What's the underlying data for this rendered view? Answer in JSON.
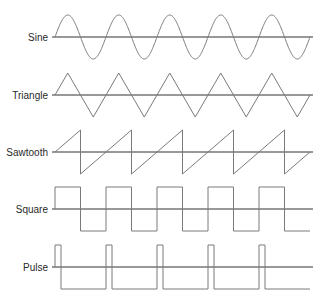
{
  "diagram": {
    "title": "",
    "colors": {
      "axis": "#333333",
      "wave": "#7a7a7a",
      "label": "#2a2a2a",
      "background": "#ffffff"
    },
    "geometry": {
      "x_start": 55,
      "x_end": 310,
      "cycles": 5,
      "amplitude": 22,
      "label_right_x": 50
    },
    "waveforms": [
      {
        "name": "sine",
        "label": "Sine",
        "type": "sine",
        "axis_y": 37
      },
      {
        "name": "triangle",
        "label": "Triangle",
        "type": "triangle",
        "axis_y": 95
      },
      {
        "name": "sawtooth",
        "label": "Sawtooth",
        "type": "sawtooth",
        "axis_y": 152
      },
      {
        "name": "square",
        "label": "Square",
        "type": "square",
        "axis_y": 209
      },
      {
        "name": "pulse",
        "label": "Pulse",
        "type": "pulse",
        "axis_y": 267,
        "pulse_width": 6
      }
    ]
  }
}
